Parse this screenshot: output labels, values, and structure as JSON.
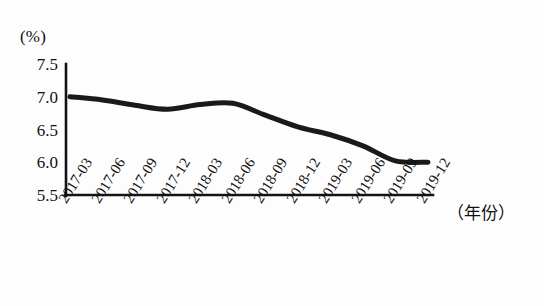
{
  "chart_data": {
    "type": "line",
    "title": "",
    "xlabel": "（年份）",
    "ylabel": "(%)",
    "categories": [
      "2017-03",
      "2017-06",
      "2017-09",
      "2017-12",
      "2018-03",
      "2018-06",
      "2018-09",
      "2018-12",
      "2019-03",
      "2019-06",
      "2019-09",
      "2019-12"
    ],
    "values": [
      7.0,
      6.95,
      6.87,
      6.81,
      6.88,
      6.9,
      6.72,
      6.54,
      6.42,
      6.25,
      6.02,
      6.0
    ],
    "ylim": [
      5.5,
      7.5
    ],
    "yticks": [
      "7.5",
      "7.0",
      "6.5",
      "6.0",
      "5.5"
    ],
    "ytick_values": [
      7.5,
      7.0,
      6.5,
      6.0,
      5.5
    ],
    "grid": false,
    "legend": null,
    "series_color": "#1a1a1a",
    "line_width": 5
  },
  "axis": {
    "unit_label": "(%)",
    "x_title": "（年份）"
  }
}
